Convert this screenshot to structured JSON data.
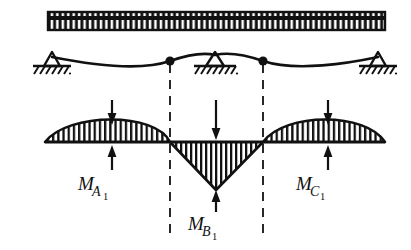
{
  "figure": {
    "width": 411,
    "height": 250,
    "background_color": "#ffffff",
    "ink_color": "#111111"
  },
  "load_bar": {
    "name": "uniform-distributed-load",
    "x_start": 48,
    "x_end": 385,
    "y_top": 12,
    "y_bottom": 30,
    "hatch_count": 62,
    "hatch_style": "vertical-bars",
    "fill_color": "#111111"
  },
  "beam": {
    "name": "deflected-beam",
    "baseline_y": 57,
    "supports": [
      {
        "id": "support-left",
        "label": "A",
        "x": 52,
        "y": 57,
        "type": "pin-with-ground-hatch"
      },
      {
        "id": "support-middle",
        "label": "B",
        "x": 215,
        "y": 55,
        "type": "pin-with-ground-hatch"
      },
      {
        "id": "support-right",
        "label": "C",
        "x": 378,
        "y": 57,
        "type": "pin-with-ground-hatch"
      }
    ],
    "inflection_points": [
      {
        "id": "inflection-point-left",
        "x": 170,
        "y": 61
      },
      {
        "id": "inflection-point-right",
        "x": 263,
        "y": 61
      }
    ],
    "sag_depth_px": 12,
    "hog_rise_px": 9
  },
  "section_lines": {
    "name": "inflection-section-lines",
    "style": "dashed",
    "lines": [
      {
        "id": "dashed-line-left",
        "x": 170,
        "y_top": 60,
        "y_bottom": 238
      },
      {
        "id": "dashed-line-right",
        "x": 263,
        "y_top": 60,
        "y_bottom": 238
      }
    ]
  },
  "moment_diagram": {
    "name": "bending-moment-diagram",
    "baseline_y": 142,
    "x_start": 45,
    "x_end": 385,
    "hatch_style": "vertical-lines",
    "regions": [
      {
        "id": "positive-moment-span-AB",
        "sign": "positive",
        "x_start": 45,
        "x_end": 170,
        "peak_x": 112,
        "peak_offset_px": -28,
        "shape": "parabolic-hump-above-axis"
      },
      {
        "id": "negative-moment-over-B",
        "sign": "negative",
        "x_start": 170,
        "x_end": 263,
        "peak_x": 216,
        "peak_offset_px": 48,
        "shape": "triangular-below-axis"
      },
      {
        "id": "positive-moment-span-BC",
        "sign": "positive",
        "x_start": 263,
        "x_end": 385,
        "peak_x": 328,
        "peak_offset_px": -28,
        "shape": "parabolic-hump-above-axis"
      }
    ]
  },
  "annotations": [
    {
      "id": "annotation-MA1",
      "label_main": "M",
      "label_sub": "A",
      "label_subsub": "1",
      "label_text": "M_A1",
      "label_x": 78,
      "label_y": 190,
      "arrow_down": {
        "x": 112,
        "y_start": 100,
        "y_end": 122
      },
      "arrow_up": {
        "x": 112,
        "y_start": 170,
        "y_end": 147
      }
    },
    {
      "id": "annotation-MB1",
      "label_main": "M",
      "label_sub": "B",
      "label_subsub": "1",
      "label_text": "M_B1",
      "label_x": 188,
      "label_y": 230,
      "arrow_down": {
        "x": 216,
        "y_start": 100,
        "y_end": 137
      },
      "arrow_up": {
        "x": 216,
        "y_start": 212,
        "y_end": 193
      }
    },
    {
      "id": "annotation-MC1",
      "label_main": "M",
      "label_sub": "C",
      "label_subsub": "1",
      "label_text": "M_C1",
      "label_x": 296,
      "label_y": 190,
      "arrow_down": {
        "x": 328,
        "y_start": 100,
        "y_end": 122
      },
      "arrow_up": {
        "x": 328,
        "y_start": 170,
        "y_end": 147
      }
    }
  ]
}
